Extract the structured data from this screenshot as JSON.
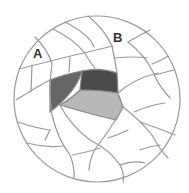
{
  "diagram": {
    "type": "circular segmented map",
    "circle": {
      "cx": 97,
      "cy": 99,
      "r": 83
    },
    "colors": {
      "background": "#ffffff",
      "line": "#9a9a9a",
      "region_left": "#666666",
      "region_top_right": "#4a4a4a",
      "region_bottom": "#b8b8b8",
      "label": "#333333"
    },
    "labels": [
      {
        "id": "A",
        "text": "A",
        "x": 33,
        "y": 47
      },
      {
        "id": "B",
        "text": "B",
        "x": 113,
        "y": 31
      }
    ],
    "shaded_regions": [
      {
        "name": "left-dark-region",
        "shade": "medium-dark"
      },
      {
        "name": "top-right-darkest-region",
        "shade": "darkest"
      },
      {
        "name": "bottom-light-region",
        "shade": "light"
      }
    ]
  }
}
